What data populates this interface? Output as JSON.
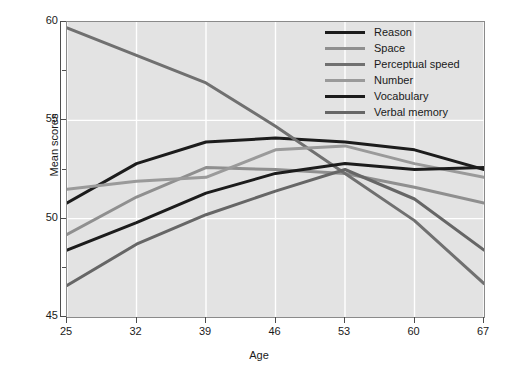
{
  "chart_data": {
    "type": "line",
    "title": "",
    "xlabel": "Age",
    "ylabel": "Mean scores",
    "x": [
      25,
      32,
      39,
      46,
      53,
      60,
      67
    ],
    "xticklabels": [
      "25",
      "32",
      "39",
      "46",
      "53",
      "60",
      "67"
    ],
    "yticklabels": [
      "45",
      "50",
      "55",
      "60"
    ],
    "yticks": [
      45,
      50,
      55,
      60
    ],
    "yminorticks": [
      47.5,
      52.5,
      57.5
    ],
    "xlim": [
      25,
      67
    ],
    "ylim": [
      45,
      60
    ],
    "grid": true,
    "legend_position": "top-right",
    "background": "#e3e3e3",
    "gridcolor": "#ffffff",
    "series": [
      {
        "name": "Reason",
        "color": "#1c1c1c",
        "width": 3.0,
        "values": [
          50.8,
          52.8,
          53.9,
          54.1,
          53.9,
          53.5,
          52.5
        ]
      },
      {
        "name": "Space",
        "color": "#8f8f8f",
        "width": 3.0,
        "values": [
          49.2,
          51.1,
          52.6,
          52.5,
          52.3,
          51.6,
          50.8
        ]
      },
      {
        "name": "Perceptual speed",
        "color": "#707070",
        "width": 3.0,
        "values": [
          59.7,
          58.3,
          56.9,
          54.7,
          52.3,
          49.9,
          46.7
        ]
      },
      {
        "name": "Number",
        "color": "#9a9a9a",
        "width": 3.0,
        "values": [
          51.5,
          51.9,
          52.1,
          53.5,
          53.7,
          52.8,
          52.1
        ]
      },
      {
        "name": "Vocabulary",
        "color": "#1c1c1c",
        "width": 3.0,
        "values": [
          48.4,
          49.8,
          51.3,
          52.3,
          52.8,
          52.5,
          52.6
        ]
      },
      {
        "name": "Verbal memory",
        "color": "#666666",
        "width": 3.0,
        "values": [
          46.6,
          48.7,
          50.2,
          51.4,
          52.5,
          51.0,
          48.4
        ]
      }
    ]
  },
  "legend": {
    "items": [
      {
        "label": "Reason"
      },
      {
        "label": "Space"
      },
      {
        "label": "Perceptual speed"
      },
      {
        "label": "Number"
      },
      {
        "label": "Vocabulary"
      },
      {
        "label": "Verbal memory"
      }
    ]
  }
}
